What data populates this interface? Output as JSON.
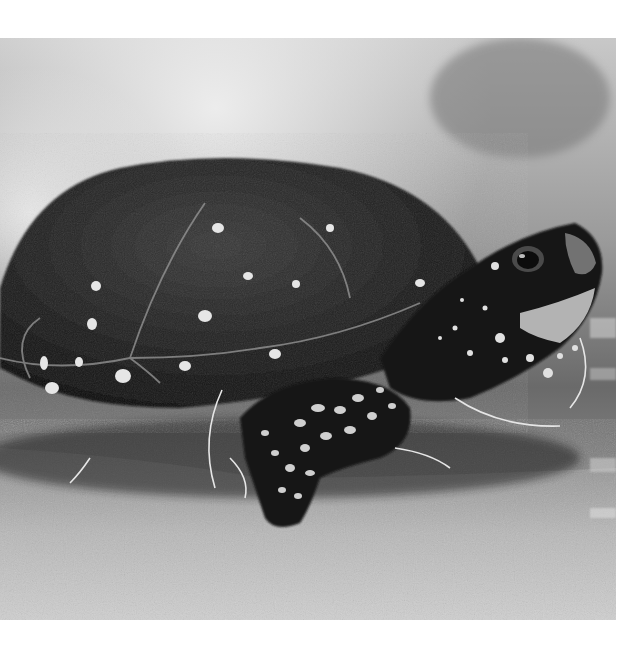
{
  "image": {
    "subject": "spotted turtle",
    "style": "black-and-white photograph",
    "alt": "Black and white photograph of a spotted turtle on mossy ground, head raised to the right",
    "colors": {
      "background_top": "#d9d9d9",
      "shell": "#1e1e1e",
      "spots": "#e8e8e8",
      "ground": "#b5b5b5",
      "frame": "#ffffff"
    }
  }
}
